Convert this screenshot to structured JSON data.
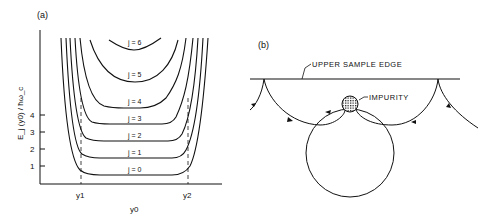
{
  "panel_a": {
    "label": "(a)",
    "ylabel": "E_j (y0) / ħω_c",
    "xlabel": "y0",
    "yticks": [
      "1",
      "2",
      "3",
      "4"
    ],
    "xmarks": [
      "y1",
      "y2"
    ],
    "curves": [
      {
        "label": "j = 0",
        "level": 0.5
      },
      {
        "label": "j = 1",
        "level": 1.5
      },
      {
        "label": "j = 2",
        "level": 2.5
      },
      {
        "label": "j = 3",
        "level": 3.5
      },
      {
        "label": "j = 4",
        "level": 4.5
      },
      {
        "label": "j = 5",
        "level": 5.5
      },
      {
        "label": "j = 6",
        "level": 6.5
      }
    ]
  },
  "panel_b": {
    "label": "(b)",
    "edge_label": "UPPER SAMPLE EDGE",
    "impurity_label": "IMPURITY"
  },
  "colors": {
    "ink": "#111111",
    "background": "#ffffff"
  }
}
